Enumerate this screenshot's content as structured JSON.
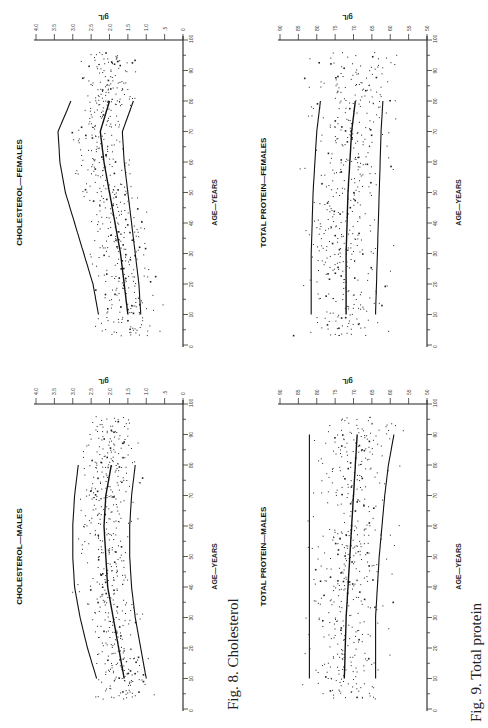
{
  "captions": {
    "fig8": "Fig. 8. Cholesterol",
    "fig9": "Fig. 9. Total protein"
  },
  "chart_data": [
    {
      "id": "chol-females",
      "type": "scatter",
      "title": "CHOLESTEROL—FEMALES",
      "xlabel": "AGE—YEARS",
      "ylabel": "g/L",
      "xlim": [
        0,
        100
      ],
      "ylim": [
        0,
        4.0
      ],
      "xticks": [
        0,
        10,
        20,
        30,
        40,
        50,
        60,
        70,
        80,
        90,
        100
      ],
      "yticks": [
        0,
        0.5,
        1.0,
        1.5,
        2.0,
        2.5,
        3.0,
        3.5,
        4.0
      ],
      "ytick_labels": [
        "0",
        ".5",
        "1.0",
        "1.5",
        "2.0",
        "2.5",
        "3.0",
        "3.5",
        "4.0"
      ],
      "series": [
        {
          "name": "upper",
          "x": [
            10,
            20,
            30,
            40,
            50,
            60,
            70,
            80
          ],
          "y": [
            2.3,
            2.45,
            2.7,
            2.95,
            3.2,
            3.35,
            3.4,
            3.05
          ]
        },
        {
          "name": "median",
          "x": [
            10,
            20,
            30,
            40,
            50,
            60,
            70,
            80
          ],
          "y": [
            1.5,
            1.6,
            1.7,
            1.85,
            2.0,
            2.15,
            2.25,
            2.0
          ]
        },
        {
          "name": "lower",
          "x": [
            10,
            20,
            30,
            40,
            50,
            60,
            70,
            80
          ],
          "y": [
            1.15,
            1.2,
            1.3,
            1.4,
            1.5,
            1.6,
            1.65,
            1.35
          ]
        }
      ],
      "scatter": {
        "center": "median",
        "spread": 0.45,
        "n": 520,
        "seed": 11
      }
    },
    {
      "id": "chol-males",
      "type": "scatter",
      "title": "CHOLESTEROL—MALES",
      "xlabel": "AGE—YEARS",
      "ylabel": "g/L",
      "xlim": [
        0,
        100
      ],
      "ylim": [
        0,
        4.0
      ],
      "xticks": [
        0,
        10,
        20,
        30,
        40,
        50,
        60,
        70,
        80,
        90,
        100
      ],
      "yticks": [
        0,
        0.5,
        1.0,
        1.5,
        2.0,
        2.5,
        3.0,
        3.5,
        4.0
      ],
      "ytick_labels": [
        "0",
        ".5",
        "1.0",
        "1.5",
        "2.0",
        "2.5",
        "3.0",
        "3.5",
        "4.0"
      ],
      "series": [
        {
          "name": "upper",
          "x": [
            10,
            20,
            30,
            40,
            50,
            60,
            70,
            80
          ],
          "y": [
            2.35,
            2.6,
            2.8,
            2.95,
            3.0,
            3.0,
            2.95,
            2.85
          ]
        },
        {
          "name": "median",
          "x": [
            10,
            20,
            30,
            40,
            50,
            60,
            70,
            80
          ],
          "y": [
            1.6,
            1.75,
            1.9,
            2.05,
            2.1,
            2.15,
            2.1,
            1.95
          ]
        },
        {
          "name": "lower",
          "x": [
            10,
            20,
            30,
            40,
            50,
            60,
            70,
            80
          ],
          "y": [
            1.0,
            1.15,
            1.3,
            1.4,
            1.45,
            1.45,
            1.4,
            1.3
          ]
        }
      ],
      "scatter": {
        "center": "median",
        "spread": 0.45,
        "n": 520,
        "seed": 23
      }
    },
    {
      "id": "protein-females",
      "type": "scatter",
      "title": "TOTAL PROTEIN—FEMALES",
      "xlabel": "AGE—YEARS",
      "ylabel": "g/L",
      "xlim": [
        0,
        100
      ],
      "ylim": [
        50,
        90
      ],
      "xticks": [
        0,
        10,
        20,
        30,
        40,
        50,
        60,
        70,
        80,
        90,
        100
      ],
      "yticks": [
        50,
        55,
        60,
        65,
        70,
        75,
        80,
        85,
        90
      ],
      "ytick_labels": [
        "50",
        "55",
        "60",
        "65",
        "70",
        "75",
        "80",
        "85",
        "90"
      ],
      "series": [
        {
          "name": "upper",
          "x": [
            10,
            30,
            50,
            70,
            80
          ],
          "y": [
            81.5,
            81.5,
            81.0,
            80.0,
            79.0
          ]
        },
        {
          "name": "median",
          "x": [
            10,
            30,
            50,
            70,
            80
          ],
          "y": [
            72.0,
            72.0,
            71.5,
            70.5,
            69.5
          ]
        },
        {
          "name": "lower",
          "x": [
            10,
            30,
            50,
            70,
            80
          ],
          "y": [
            64.0,
            63.5,
            63.0,
            62.5,
            62.0
          ]
        }
      ],
      "scatter": {
        "center": "median",
        "spread": 6.5,
        "n": 480,
        "seed": 37
      }
    },
    {
      "id": "protein-males",
      "type": "scatter",
      "title": "TOTAL PROTEIN—MALES",
      "xlabel": "AGE—YEARS",
      "ylabel": "g/L",
      "xlim": [
        0,
        100
      ],
      "ylim": [
        50,
        90
      ],
      "xticks": [
        0,
        10,
        20,
        30,
        40,
        50,
        60,
        70,
        80,
        90,
        100
      ],
      "yticks": [
        50,
        55,
        60,
        65,
        70,
        75,
        80,
        85,
        90
      ],
      "ytick_labels": [
        "50",
        "55",
        "60",
        "65",
        "70",
        "75",
        "80",
        "85",
        "90"
      ],
      "series": [
        {
          "name": "upper",
          "x": [
            10,
            50,
            90
          ],
          "y": [
            82.0,
            82.0,
            82.0
          ]
        },
        {
          "name": "median",
          "x": [
            10,
            30,
            50,
            70,
            90
          ],
          "y": [
            72.5,
            72.0,
            71.0,
            70.0,
            69.0
          ]
        },
        {
          "name": "lower",
          "x": [
            10,
            30,
            50,
            70,
            80,
            90
          ],
          "y": [
            64.0,
            64.0,
            63.0,
            61.5,
            60.5,
            59.0
          ]
        }
      ],
      "scatter": {
        "center": "median",
        "spread": 6.5,
        "n": 480,
        "seed": 53
      }
    }
  ]
}
